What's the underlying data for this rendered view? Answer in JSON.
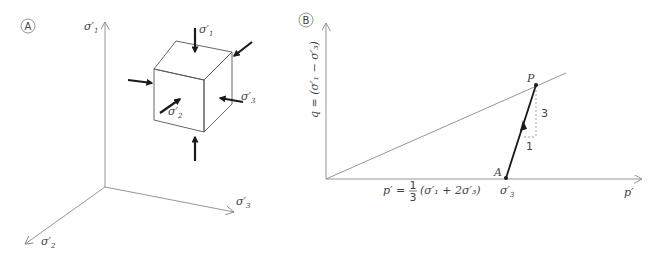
{
  "panels": {
    "a": {
      "badge": "A",
      "axes": {
        "sigma1": {
          "sym": "σ",
          "prime": "′",
          "sub": "1"
        },
        "sigma2": {
          "sym": "σ",
          "prime": "′",
          "sub": "2"
        },
        "sigma3": {
          "sym": "σ",
          "prime": "′",
          "sub": "3"
        }
      },
      "cube_labels": {
        "top": {
          "sym": "σ",
          "prime": "′",
          "sub": "1"
        },
        "front": {
          "sym": "σ",
          "prime": "′",
          "sub": "2"
        },
        "right": {
          "sym": "σ",
          "prime": "′",
          "sub": "3"
        }
      }
    },
    "b": {
      "badge": "B",
      "y_axis_label": "q = (σ′₁ − σ′₃)",
      "x_axis_label": "p′",
      "p_formula": {
        "lhs": "p′ = ",
        "num": "1",
        "den": "3",
        "rhs": "(σ′₁ + 2σ′₃)"
      },
      "point_p": "P",
      "point_a": "A",
      "a_value": {
        "sym": "σ",
        "prime": "′",
        "sub": "3"
      },
      "slope_rise": "3",
      "slope_run": "1"
    }
  }
}
